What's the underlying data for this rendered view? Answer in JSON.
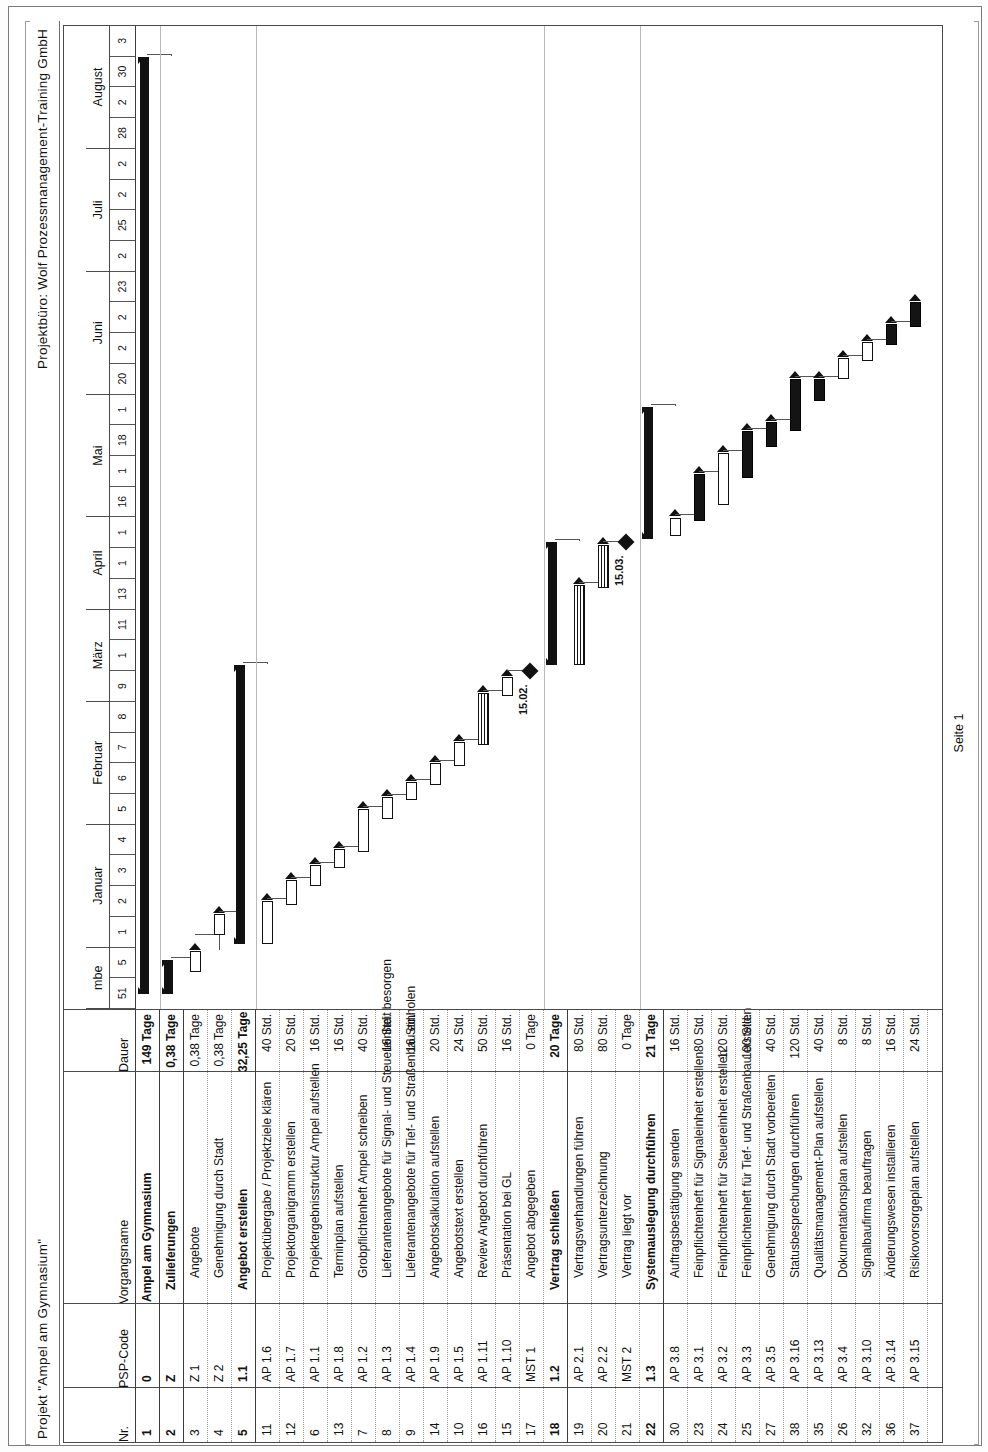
{
  "header": {
    "project_title": "Projekt \"Ampel am Gymnasium\"",
    "company": "Projektbüro: Wolf Prozessmanagement-Training GmbH"
  },
  "footer": {
    "page_label": "Seite 1"
  },
  "table": {
    "columns": [
      "Nr.",
      "PSP-Code",
      "Vorgangsname",
      "Dauer"
    ],
    "rows": [
      {
        "nr": "1",
        "psp": "0",
        "name": "Ampel am Gymnasium",
        "dauer": "149 Tage",
        "level": 0
      },
      {
        "nr": "2",
        "psp": "Z",
        "name": "Zulieferungen",
        "dauer": "0,38 Tage",
        "level": 1
      },
      {
        "nr": "3",
        "psp": "Z 1",
        "name": "Angebote",
        "dauer": "0,38 Tage",
        "level": 2
      },
      {
        "nr": "4",
        "psp": "Z 2",
        "name": "Genehmigung durch Stadt",
        "dauer": "0,38 Tage",
        "level": 2
      },
      {
        "nr": "5",
        "psp": "1.1",
        "name": "Angebot erstellen",
        "dauer": "32,25 Tage",
        "level": 1
      },
      {
        "nr": "11",
        "psp": "AP 1.6",
        "name": "Projektübergabe / Projektziele klären",
        "dauer": "40 Std.",
        "level": 2
      },
      {
        "nr": "12",
        "psp": "AP 1.7",
        "name": "Projektorganigramm erstellen",
        "dauer": "20 Std.",
        "level": 2
      },
      {
        "nr": "6",
        "psp": "AP 1.1",
        "name": "Projektergebnisstruktur Ampel aufstellen",
        "dauer": "16 Std.",
        "level": 2
      },
      {
        "nr": "13",
        "psp": "AP 1.8",
        "name": "Terminplan aufstellen",
        "dauer": "16 Std.",
        "level": 2
      },
      {
        "nr": "7",
        "psp": "AP 1.2",
        "name": "Grobpflichtenheft Ampel schreiben",
        "dauer": "40 Std.",
        "level": 2
      },
      {
        "nr": "8",
        "psp": "AP 1.3",
        "name": "Lieferantenangebote für Signal- und Steuereinheit besorgen",
        "dauer": "16 Std.",
        "level": 2
      },
      {
        "nr": "9",
        "psp": "AP 1.4",
        "name": "Lieferantenangebote für Tief- und Straßenbau einholen",
        "dauer": "16 Std.",
        "level": 2
      },
      {
        "nr": "14",
        "psp": "AP 1.9",
        "name": "Angebotskalkulation aufstellen",
        "dauer": "20 Std.",
        "level": 2
      },
      {
        "nr": "10",
        "psp": "AP 1.5",
        "name": "Angebotstext erstellen",
        "dauer": "24 Std.",
        "level": 2
      },
      {
        "nr": "16",
        "psp": "AP 1.11",
        "name": "Review Angebot durchführen",
        "dauer": "50 Std.",
        "level": 2
      },
      {
        "nr": "15",
        "psp": "AP 1.10",
        "name": "Präsentation bei GL",
        "dauer": "16 Std.",
        "level": 2
      },
      {
        "nr": "17",
        "psp": "MST 1",
        "name": "Angebot abgegeben",
        "dauer": "0 Tage",
        "level": 2
      },
      {
        "nr": "18",
        "psp": "1.2",
        "name": "Vertrag schließen",
        "dauer": "20 Tage",
        "level": 1
      },
      {
        "nr": "19",
        "psp": "AP 2.1",
        "name": "Vertragsverhandlungen führen",
        "dauer": "80 Std.",
        "level": 2
      },
      {
        "nr": "20",
        "psp": "AP 2.2",
        "name": "Vertragsunterzeichnung",
        "dauer": "80 Std.",
        "level": 2
      },
      {
        "nr": "21",
        "psp": "MST 2",
        "name": "Vertrag liegt vor",
        "dauer": "0 Tage",
        "level": 2
      },
      {
        "nr": "22",
        "psp": "1.3",
        "name": "Systemauslegung durchführen",
        "dauer": "21 Tage",
        "level": 1
      },
      {
        "nr": "30",
        "psp": "AP 3.8",
        "name": "Auftragsbestätigung senden",
        "dauer": "16 Std.",
        "level": 2
      },
      {
        "nr": "23",
        "psp": "AP 3.1",
        "name": "Feinpflichtenheft für Signaleinheit erstellen",
        "dauer": "80 Std.",
        "level": 2
      },
      {
        "nr": "24",
        "psp": "AP 3.2",
        "name": "Feinpflichtenheft für Steuereinheit erstellen",
        "dauer": "120 Std.",
        "level": 2
      },
      {
        "nr": "25",
        "psp": "AP 3.3",
        "name": "Feinpflichtenheft für Tief- und Straßenbau erstellen",
        "dauer": "100 Std.",
        "level": 2
      },
      {
        "nr": "27",
        "psp": "AP 3.5",
        "name": "Genehmigung durch Stadt vorbereiten",
        "dauer": "40 Std.",
        "level": 2
      },
      {
        "nr": "38",
        "psp": "AP 3.16",
        "name": "Statusbesprechungen durchführen",
        "dauer": "120 Std.",
        "level": 2
      },
      {
        "nr": "35",
        "psp": "AP 3.13",
        "name": "Qualitätsmanagement-Plan aufstellen",
        "dauer": "40 Std.",
        "level": 2
      },
      {
        "nr": "26",
        "psp": "AP 3.4",
        "name": "Dokumentationsplan aufstellen",
        "dauer": "8 Std.",
        "level": 2
      },
      {
        "nr": "32",
        "psp": "AP 3.10",
        "name": "Signalbaufirma beauftragen",
        "dauer": "8 Std.",
        "level": 2
      },
      {
        "nr": "36",
        "psp": "AP 3.14",
        "name": "Änderungswesen installieren",
        "dauer": "16 Std.",
        "level": 2
      },
      {
        "nr": "37",
        "psp": "AP 3.15",
        "name": "Risikovorsorgeplan aufstellen",
        "dauer": "24 Std.",
        "level": 2
      }
    ]
  },
  "chart_data": {
    "type": "gantt",
    "timescale": {
      "unit_major": "Monat",
      "unit_minor": "Kalenderwoche",
      "months": [
        {
          "label": "mbe",
          "weeks": [
            "51",
            "5"
          ]
        },
        {
          "label": "Januar",
          "weeks": [
            "1",
            "2",
            "3",
            "4"
          ]
        },
        {
          "label": "Februar",
          "weeks": [
            "5",
            "6",
            "7",
            "8"
          ]
        },
        {
          "label": "März",
          "weeks": [
            "9",
            "1",
            "11"
          ]
        },
        {
          "label": "April",
          "weeks": [
            "13",
            "1",
            "1"
          ]
        },
        {
          "label": "Mai",
          "weeks": [
            "16",
            "1",
            "18",
            "1"
          ]
        },
        {
          "label": "Juni",
          "weeks": [
            "20",
            "2",
            "2",
            "23"
          ]
        },
        {
          "label": "Juli",
          "weeks": [
            "2",
            "25",
            "2",
            "2"
          ]
        },
        {
          "label": "August",
          "weeks": [
            "28",
            "2",
            "30",
            "3"
          ]
        }
      ]
    },
    "milestones": [
      {
        "label": "15.02.",
        "row": 16
      },
      {
        "label": "15.03.",
        "row": 20
      }
    ],
    "bars": [
      {
        "row": 0,
        "start": 0.5,
        "end": 31.0,
        "kind": "summary"
      },
      {
        "row": 1,
        "start": 0.5,
        "end": 1.6,
        "kind": "summary"
      },
      {
        "row": 2,
        "start": 1.2,
        "end": 1.9,
        "kind": "link"
      },
      {
        "row": 3,
        "start": 2.4,
        "end": 3.1,
        "kind": "link"
      },
      {
        "row": 4,
        "start": 2.1,
        "end": 11.2,
        "kind": "summary"
      },
      {
        "row": 5,
        "start": 2.1,
        "end": 3.5,
        "kind": "task"
      },
      {
        "row": 6,
        "start": 3.4,
        "end": 4.2,
        "kind": "task"
      },
      {
        "row": 7,
        "start": 4.0,
        "end": 4.7,
        "kind": "task"
      },
      {
        "row": 8,
        "start": 4.6,
        "end": 5.2,
        "kind": "task"
      },
      {
        "row": 9,
        "start": 5.1,
        "end": 6.5,
        "kind": "task"
      },
      {
        "row": 10,
        "start": 6.2,
        "end": 6.9,
        "kind": "task"
      },
      {
        "row": 11,
        "start": 6.8,
        "end": 7.4,
        "kind": "task"
      },
      {
        "row": 12,
        "start": 7.3,
        "end": 8.0,
        "kind": "task"
      },
      {
        "row": 13,
        "start": 7.9,
        "end": 8.7,
        "kind": "task"
      },
      {
        "row": 14,
        "start": 8.6,
        "end": 10.3,
        "kind": "hatch"
      },
      {
        "row": 15,
        "start": 10.2,
        "end": 10.8,
        "kind": "task"
      },
      {
        "row": 16,
        "start": 11.0,
        "end": 11.0,
        "kind": "milestone"
      },
      {
        "row": 17,
        "start": 11.2,
        "end": 15.2,
        "kind": "summary"
      },
      {
        "row": 18,
        "start": 11.2,
        "end": 13.8,
        "kind": "hatch"
      },
      {
        "row": 19,
        "start": 13.7,
        "end": 15.1,
        "kind": "hatch"
      },
      {
        "row": 20,
        "start": 15.2,
        "end": 15.2,
        "kind": "milestone"
      },
      {
        "row": 21,
        "start": 15.3,
        "end": 19.6,
        "kind": "summary"
      },
      {
        "row": 22,
        "start": 15.4,
        "end": 16.0,
        "kind": "task"
      },
      {
        "row": 23,
        "start": 15.9,
        "end": 17.4,
        "kind": "crit"
      },
      {
        "row": 24,
        "start": 16.4,
        "end": 18.1,
        "kind": "task"
      },
      {
        "row": 25,
        "start": 17.3,
        "end": 18.8,
        "kind": "crit"
      },
      {
        "row": 26,
        "start": 18.3,
        "end": 19.1,
        "kind": "crit"
      },
      {
        "row": 27,
        "start": 18.8,
        "end": 20.5,
        "kind": "crit"
      },
      {
        "row": 28,
        "start": 19.8,
        "end": 20.5,
        "kind": "crit"
      },
      {
        "row": 29,
        "start": 20.5,
        "end": 21.2,
        "kind": "task"
      },
      {
        "row": 30,
        "start": 21.1,
        "end": 21.7,
        "kind": "task"
      },
      {
        "row": 31,
        "start": 21.6,
        "end": 22.3,
        "kind": "crit"
      },
      {
        "row": 32,
        "start": 22.2,
        "end": 23.0,
        "kind": "crit"
      }
    ]
  }
}
